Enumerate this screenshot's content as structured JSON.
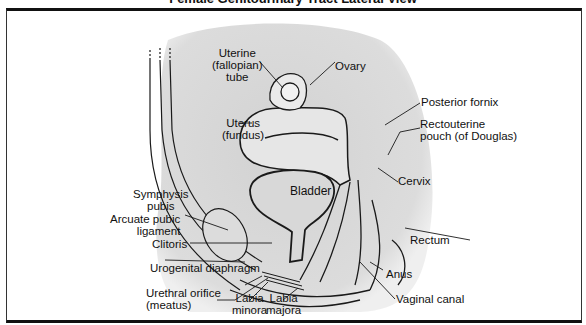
{
  "title": "Female Genitourinary Tract Lateral View",
  "colors": {
    "shading": "#d6d6d6",
    "line": "#1a1a1a",
    "frame": "#111111",
    "background": "#ffffff"
  },
  "labels": {
    "uterine_tube": "Uterine\n(fallopian)\ntube",
    "ovary": "Ovary",
    "uterus": "Uterus\n(fundus)",
    "posterior_fornix": "Posterior fornix",
    "rectouterine_pouch": "Rectouterine\npouch (of Douglas)",
    "cervix": "Cervix",
    "bladder": "Bladder",
    "symphysis_pubis": "Symphysis\npubis",
    "arcuate_pubic_ligament": "Arcuate pubic\nligament",
    "clitoris": "Clitoris",
    "urogenital_diaphragm": "Urogenital diaphragm",
    "urethral_orifice": "Urethral orifice\n(meatus)",
    "labia_minora": "Labia\nminora",
    "labia_majora": "Labia\nmajora",
    "rectum": "Rectum",
    "anus": "Anus",
    "vaginal_canal": "Vaginal canal"
  }
}
